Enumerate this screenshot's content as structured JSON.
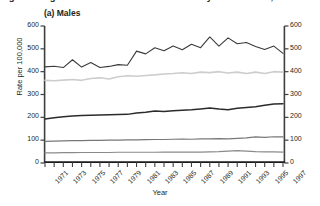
{
  "figure": {
    "caption_cutoff": "Figure 3. Age-standardised incidence rates by site and sex, 1971–1997",
    "panel_title": "(a) Males",
    "xlabel": "Year",
    "ylabel": "Rate per 100,000"
  },
  "chart_data": {
    "type": "line",
    "title": "(a) Males",
    "xlabel": "Year",
    "ylabel": "Rate per 100,000",
    "xlim": [
      1971,
      1997
    ],
    "ylim": [
      0,
      600
    ],
    "ytick_labels": [
      "0",
      "100",
      "200",
      "300",
      "400",
      "500",
      "600"
    ],
    "yticks": [
      0,
      100,
      200,
      300,
      400,
      500,
      600
    ],
    "xtick_labels": [
      "1971",
      "1973",
      "1975",
      "1977",
      "1979",
      "1981",
      "1983",
      "1985",
      "1987",
      "1989",
      "1991",
      "1993",
      "1995",
      "1997"
    ],
    "xticks": [
      1971,
      1973,
      1975,
      1977,
      1979,
      1981,
      1983,
      1985,
      1987,
      1989,
      1991,
      1993,
      1995,
      1997
    ],
    "grid": false,
    "legend": "none",
    "dual_y_axis": true,
    "x": [
      1971,
      1972,
      1973,
      1974,
      1975,
      1976,
      1977,
      1978,
      1979,
      1980,
      1981,
      1982,
      1983,
      1984,
      1985,
      1986,
      1987,
      1988,
      1989,
      1990,
      1991,
      1992,
      1993,
      1994,
      1995,
      1996,
      1997
    ],
    "series": [
      {
        "name": "series-1",
        "color": "#3a3a3a",
        "linewidth": 1.1,
        "values": [
          421,
          424,
          418,
          452,
          420,
          440,
          418,
          423,
          431,
          428,
          490,
          478,
          505,
          492,
          512,
          496,
          520,
          505,
          552,
          512,
          548,
          522,
          528,
          510,
          497,
          512,
          480
        ]
      },
      {
        "name": "series-2",
        "color": "#cdcdcd",
        "linewidth": 1.6,
        "values": [
          362,
          360,
          363,
          366,
          362,
          370,
          373,
          368,
          378,
          382,
          380,
          383,
          386,
          390,
          392,
          395,
          392,
          398,
          396,
          400,
          394,
          398,
          392,
          398,
          392,
          400,
          398
        ]
      },
      {
        "name": "series-3",
        "color": "#2b2b2b",
        "linewidth": 1.5,
        "values": [
          193,
          198,
          203,
          206,
          208,
          209,
          210,
          211,
          212,
          213,
          219,
          222,
          228,
          226,
          229,
          231,
          233,
          237,
          241,
          236,
          233,
          240,
          243,
          246,
          253,
          258,
          260
        ]
      },
      {
        "name": "series-4",
        "color": "#777777",
        "linewidth": 1.2,
        "values": [
          95,
          96,
          97,
          98,
          98,
          99,
          99,
          100,
          100,
          101,
          101,
          102,
          103,
          103,
          104,
          105,
          104,
          106,
          106,
          107,
          106,
          108,
          110,
          114,
          112,
          115,
          114
        ]
      },
      {
        "name": "series-5",
        "color": "#8a8a8a",
        "linewidth": 1.2,
        "values": [
          44,
          44,
          45,
          45,
          46,
          46,
          46,
          46,
          47,
          47,
          47,
          47,
          47,
          48,
          48,
          48,
          48,
          48,
          49,
          50,
          52,
          54,
          52,
          50,
          49,
          49,
          48
        ]
      }
    ]
  }
}
